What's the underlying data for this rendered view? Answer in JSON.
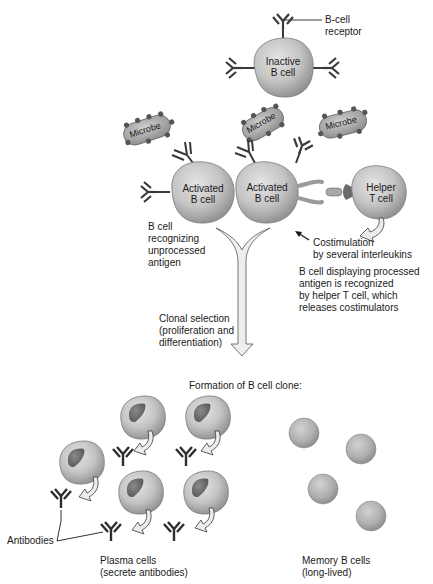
{
  "figure": {
    "type": "B cell activation and clonal selection diagram"
  },
  "cells": {
    "inactive_b_cell": {
      "label": "Inactive\nB cell"
    },
    "activated_b_cell_1": {
      "label": "Activated\nB cell"
    },
    "activated_b_cell_2": {
      "label": "Activated\nB cell"
    },
    "helper_t_cell": {
      "label": "Helper\nT cell"
    }
  },
  "microbes": [
    {
      "label": "Microbe"
    },
    {
      "label": "Microbe"
    },
    {
      "label": "Microbe"
    }
  ],
  "labels": {
    "b_cell_receptor": "B-cell\nreceptor",
    "b_cell_recognizing": "B cell\nrecognizing\nunprocessed\nantigen",
    "costimulation": "Costimulation\nby several interleukins",
    "b_cell_displaying": "B cell displaying processed\nantigen is recognized\nby helper T cell, which\nreleases costimulators",
    "clonal_selection": "Clonal selection\n(proliferation and\ndifferentiation)",
    "formation_clone": "Formation of B cell clone:",
    "antibodies": "Antibodies",
    "plasma_cells": "Plasma cells\n(secrete antibodies)",
    "memory_cells": "Memory B cells\n(long-lived)"
  },
  "colors": {
    "cell_fill": "#c8c8c8",
    "cell_shade": "#9a9a9a",
    "nucleus": "#6e6e6e",
    "line": "#3a3a3a",
    "arrow_fill": "#e6e6e6"
  }
}
